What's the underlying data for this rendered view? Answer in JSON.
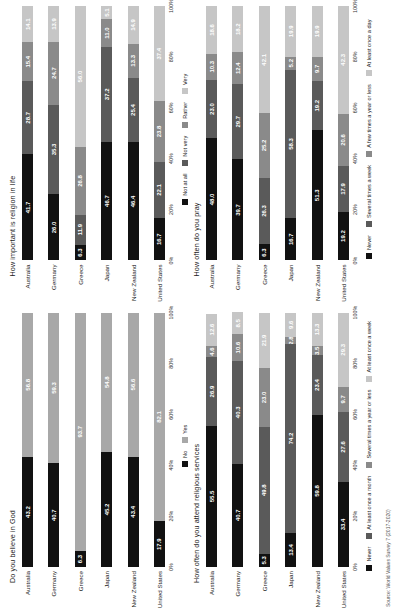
{
  "source_note": "Source: World Values Survey 7 (2017-2020)",
  "axis": {
    "ticks": [
      "0%",
      "20%",
      "40%",
      "60%",
      "80%",
      "100%"
    ],
    "tick_values": [
      0,
      20,
      40,
      60,
      80,
      100
    ]
  },
  "categories": [
    "Australia",
    "Germany",
    "Greece",
    "Japan",
    "New Zealand",
    "United States"
  ],
  "chart_data": [
    {
      "type": "bar",
      "id": "believe-in-god",
      "title": "Do you believe in God",
      "orientation": "horizontal-stacked-100",
      "xlabel": "",
      "ylabel": "",
      "xlim": [
        0,
        100
      ],
      "grid": false,
      "legend_position": "bottom",
      "categories": [
        "Australia",
        "Germany",
        "Greece",
        "Japan",
        "New Zealand",
        "United States"
      ],
      "series": [
        {
          "name": "No",
          "color": "#111111",
          "text_color": "#ffffff",
          "values": [
            43.2,
            40.7,
            6.3,
            45.2,
            43.4,
            17.9
          ]
        },
        {
          "name": "Yes",
          "color": "#a8a8a8",
          "text_color": "#ffffff",
          "values": [
            56.8,
            59.3,
            93.7,
            54.8,
            56.6,
            82.1
          ]
        }
      ]
    },
    {
      "type": "bar",
      "id": "religion-important",
      "title": "How important is religion in life",
      "orientation": "horizontal-stacked-100",
      "xlabel": "",
      "ylabel": "",
      "xlim": [
        0,
        100
      ],
      "grid": false,
      "legend_position": "bottom",
      "categories": [
        "Australia",
        "Germany",
        "Greece",
        "Japan",
        "New Zealand",
        "United States"
      ],
      "series": [
        {
          "name": "Not at all",
          "color": "#111111",
          "text_color": "#ffffff",
          "values": [
            41.7,
            26.0,
            6.3,
            46.7,
            46.4,
            16.7
          ]
        },
        {
          "name": "Not very",
          "color": "#5a5a5a",
          "text_color": "#ffffff",
          "values": [
            28.7,
            35.3,
            11.9,
            37.2,
            25.4,
            22.1
          ]
        },
        {
          "name": "Rather",
          "color": "#8a8a8a",
          "text_color": "#ffffff",
          "values": [
            15.4,
            24.7,
            26.8,
            11.0,
            13.3,
            23.8
          ]
        },
        {
          "name": "Very",
          "color": "#c6c6c6",
          "text_color": "#ffffff",
          "values": [
            14.1,
            13.9,
            56.0,
            5.1,
            14.9,
            37.4
          ]
        }
      ]
    },
    {
      "type": "bar",
      "id": "attend-services",
      "title": "How often do you attend religious services",
      "orientation": "horizontal-stacked-100",
      "xlabel": "",
      "ylabel": "",
      "xlim": [
        0,
        100
      ],
      "grid": false,
      "legend_position": "bottom",
      "categories": [
        "Australia",
        "Germany",
        "Greece",
        "Japan",
        "New Zealand",
        "United States"
      ],
      "series": [
        {
          "name": "Never",
          "color": "#111111",
          "text_color": "#ffffff",
          "values": [
            55.5,
            40.7,
            5.3,
            13.4,
            59.8,
            33.4
          ]
        },
        {
          "name": "At least once a month",
          "color": "#5a5a5a",
          "text_color": "#ffffff",
          "values": [
            26.9,
            40.3,
            49.8,
            74.2,
            23.4,
            27.6
          ]
        },
        {
          "name": "Several times a year or less",
          "color": "#8a8a8a",
          "text_color": "#ffffff",
          "values": [
            4.6,
            10.6,
            23.0,
            2.8,
            3.5,
            9.7
          ]
        },
        {
          "name": "At least once a week",
          "color": "#c6c6c6",
          "text_color": "#ffffff",
          "values": [
            12.6,
            8.5,
            21.9,
            9.6,
            13.3,
            29.3
          ]
        }
      ]
    },
    {
      "type": "bar",
      "id": "how-often-pray",
      "title": "How often do you pray",
      "orientation": "horizontal-stacked-100",
      "xlabel": "",
      "ylabel": "",
      "xlim": [
        0,
        100
      ],
      "grid": false,
      "legend_position": "bottom",
      "categories": [
        "Australia",
        "Germany",
        "Greece",
        "Japan",
        "New Zealand",
        "United States"
      ],
      "series": [
        {
          "name": "Never",
          "color": "#111111",
          "text_color": "#ffffff",
          "values": [
            48.0,
            39.7,
            6.3,
            16.7,
            51.3,
            19.2
          ]
        },
        {
          "name": "Several times a week",
          "color": "#5a5a5a",
          "text_color": "#ffffff",
          "values": [
            23.0,
            29.7,
            26.3,
            58.3,
            19.2,
            17.9
          ]
        },
        {
          "name": "A few times a year or less",
          "color": "#8a8a8a",
          "text_color": "#ffffff",
          "values": [
            10.3,
            12.4,
            25.2,
            5.2,
            9.7,
            20.6
          ]
        },
        {
          "name": "At least once a day",
          "color": "#c6c6c6",
          "text_color": "#ffffff",
          "values": [
            18.6,
            18.2,
            42.1,
            19.9,
            19.9,
            42.3
          ]
        }
      ]
    }
  ]
}
